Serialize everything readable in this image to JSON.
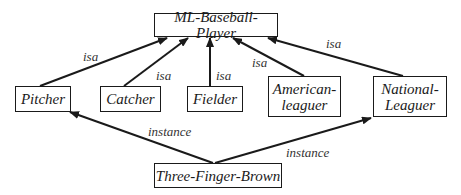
{
  "diagram": {
    "colors": {
      "stroke": "#1a1a1a",
      "background": "#ffffff"
    },
    "nodes": [
      {
        "id": "ml",
        "label": "ML-Baseball-Player",
        "x": 154,
        "y": 13,
        "w": 124,
        "h": 24
      },
      {
        "id": "pitcher",
        "label": "Pitcher",
        "x": 15,
        "y": 86,
        "w": 56,
        "h": 26
      },
      {
        "id": "catcher",
        "label": "Catcher",
        "x": 100,
        "y": 86,
        "w": 61,
        "h": 26
      },
      {
        "id": "fielder",
        "label": "Fielder",
        "x": 187,
        "y": 86,
        "w": 56,
        "h": 26
      },
      {
        "id": "american",
        "label": "American-\nleaguer",
        "x": 268,
        "y": 76,
        "w": 73,
        "h": 41
      },
      {
        "id": "national",
        "label": "National-\nLeaguer",
        "x": 373,
        "y": 76,
        "w": 74,
        "h": 41
      },
      {
        "id": "tfb",
        "label": "Three-Finger-Brown",
        "x": 154,
        "y": 163,
        "w": 128,
        "h": 25
      }
    ],
    "edges": [
      {
        "from": "pitcher",
        "to": "ml",
        "label": "isa",
        "x1": 40,
        "y1": 86,
        "x2": 167,
        "y2": 38,
        "lx": 83,
        "ly": 50
      },
      {
        "from": "catcher",
        "to": "ml",
        "label": "isa",
        "x1": 124,
        "y1": 86,
        "x2": 188,
        "y2": 38,
        "lx": 156,
        "ly": 69
      },
      {
        "from": "fielder",
        "to": "ml",
        "label": "isa",
        "x1": 210,
        "y1": 86,
        "x2": 210,
        "y2": 38,
        "lx": 216,
        "ly": 69
      },
      {
        "from": "american",
        "to": "ml",
        "label": "isa",
        "x1": 304,
        "y1": 76,
        "x2": 233,
        "y2": 38,
        "lx": 252,
        "ly": 56
      },
      {
        "from": "national",
        "to": "ml",
        "label": "isa",
        "x1": 403,
        "y1": 76,
        "x2": 268,
        "y2": 38,
        "lx": 326,
        "ly": 37
      },
      {
        "from": "tfb",
        "to": "pitcher",
        "label": "instance",
        "x1": 213,
        "y1": 163,
        "x2": 70,
        "y2": 112,
        "lx": 148,
        "ly": 125
      },
      {
        "from": "tfb",
        "to": "national",
        "label": "instance",
        "x1": 215,
        "y1": 163,
        "x2": 371,
        "y2": 118,
        "lx": 286,
        "ly": 146
      }
    ]
  }
}
